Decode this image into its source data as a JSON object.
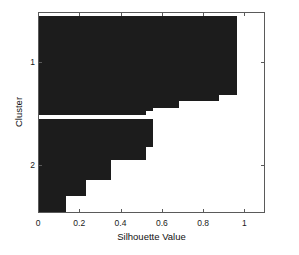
{
  "chart_data": {
    "type": "bar",
    "orientation": "horizontal",
    "title": "",
    "xlabel": "Silhouette Value",
    "ylabel": "Cluster",
    "xlim": [
      0,
      1.1
    ],
    "ylim_categories": [
      "1",
      "2"
    ],
    "xticks": [
      0,
      0.2,
      0.4,
      0.6,
      0.8,
      1
    ],
    "xticklabels": [
      "0",
      "0.2",
      "0.4",
      "0.6",
      "0.8",
      "1"
    ],
    "yticks": [
      1,
      2
    ],
    "yticklabels": [
      "1",
      "2"
    ],
    "grid": false,
    "legend": null,
    "bar_color": "#1c1c1c",
    "axis_color": "#5a5a5a",
    "background": "#ffffff",
    "series": [
      {
        "name": "Cluster 1",
        "cluster": "1",
        "values": [
          0.96,
          0.96,
          0.96,
          0.96,
          0.96,
          0.96,
          0.96,
          0.96,
          0.96,
          0.96,
          0.96,
          0.96,
          0.96,
          0.96,
          0.96,
          0.96,
          0.96,
          0.96,
          0.96,
          0.96,
          0.96,
          0.96,
          0.96,
          0.96,
          0.96,
          0.96,
          0.96,
          0.96,
          0.96,
          0.96,
          0.96,
          0.96,
          0.96,
          0.96,
          0.96,
          0.96,
          0.96,
          0.96,
          0.96,
          0.87,
          0.68,
          0.68,
          0.55,
          0.52
        ]
      },
      {
        "name": "Cluster 2",
        "cluster": "2",
        "values": [
          0.55,
          0.55,
          0.55,
          0.55,
          0.55,
          0.55,
          0.55,
          0.55,
          0.55,
          0.55,
          0.55,
          0.55,
          0.55,
          0.55,
          0.55,
          0.55,
          0.55,
          0.55,
          0.55,
          0.55,
          0.55,
          0.55,
          0.52,
          0.52,
          0.52,
          0.52,
          0.52,
          0.35,
          0.35,
          0.35,
          0.35,
          0.35,
          0.35,
          0.35,
          0.23,
          0.23,
          0.23,
          0.23,
          0.23,
          0.13,
          0.13,
          0.13,
          0.13,
          0.13,
          0.13,
          0.13,
          0.13,
          0.13,
          0.13,
          0.13
        ]
      }
    ],
    "bars_geometry": [
      {
        "cluster": "1",
        "value": 0.96,
        "y_top_frac": 0.0149,
        "y_height_frac": 0.393
      },
      {
        "cluster": "1",
        "value": 0.87,
        "y_top_frac": 0.4079,
        "y_height_frac": 0.0299
      },
      {
        "cluster": "1",
        "value": 0.68,
        "y_top_frac": 0.4378,
        "y_height_frac": 0.0348
      },
      {
        "cluster": "1",
        "value": 0.55,
        "y_top_frac": 0.4726,
        "y_height_frac": 0.0149
      },
      {
        "cluster": "1",
        "value": 0.52,
        "y_top_frac": 0.4876,
        "y_height_frac": 0.0199
      },
      {
        "cluster": "2",
        "value": 0.55,
        "y_top_frac": 0.5274,
        "y_height_frac": 0.1393
      },
      {
        "cluster": "2",
        "value": 0.52,
        "y_top_frac": 0.6667,
        "y_height_frac": 0.0647
      },
      {
        "cluster": "2",
        "value": 0.35,
        "y_top_frac": 0.7313,
        "y_height_frac": 0.0995
      },
      {
        "cluster": "2",
        "value": 0.23,
        "y_top_frac": 0.8308,
        "y_height_frac": 0.0796
      },
      {
        "cluster": "2",
        "value": 0.13,
        "y_top_frac": 0.9104,
        "y_height_frac": 0.0896
      }
    ]
  }
}
